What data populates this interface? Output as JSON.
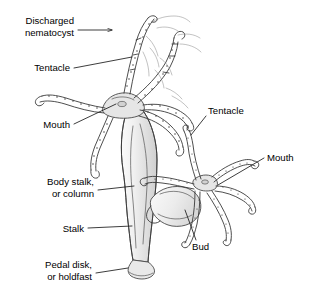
{
  "figure": {
    "background_color": "#ffffff",
    "ink_color": "#3a3a3a",
    "leader_color": "#1a1a1a",
    "body_fill_color": "#ededed",
    "width": 310,
    "height": 291
  },
  "labels": {
    "discharged_nematocyst": {
      "line1": "Discharged",
      "line2": "nematocyst",
      "side": "left",
      "has_arrowhead": true
    },
    "tentacle_left": {
      "line1": "Tentacle",
      "side": "left",
      "has_arrowhead": false
    },
    "mouth_left": {
      "line1": "Mouth",
      "side": "left",
      "has_arrowhead": false
    },
    "body_stalk": {
      "line1": "Body stalk,",
      "line2": "or column",
      "side": "left",
      "has_arrowhead": false
    },
    "stalk": {
      "line1": "Stalk",
      "side": "left",
      "has_arrowhead": false
    },
    "pedal_disk": {
      "line1": "Pedal disk,",
      "line2": "or holdfast",
      "side": "left",
      "has_arrowhead": false
    },
    "tentacle_right": {
      "line1": "Tentacle",
      "side": "right",
      "has_arrowhead": false
    },
    "mouth_right": {
      "line1": "Mouth",
      "side": "right",
      "has_arrowhead": false
    },
    "bud": {
      "line1": "Bud",
      "side": "right",
      "has_arrowhead": false
    }
  },
  "structures": {
    "parent_polyp": {
      "name": "Hydra parent polyp",
      "tentacle_count": 6,
      "has_hypostome": true,
      "has_pedal_disk": true
    },
    "bud_polyp": {
      "name": "Asexual bud",
      "tentacle_count": 6,
      "attached_to": "parent body column"
    }
  }
}
